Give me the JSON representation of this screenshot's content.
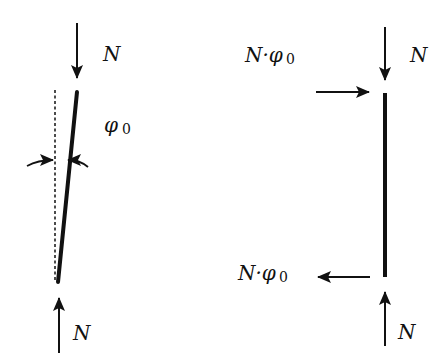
{
  "diagram": {
    "left": {
      "top_force_label": "N",
      "bottom_force_label": "N",
      "angle_symbol": "φ",
      "angle_subscript": "0"
    },
    "right": {
      "top_force_label": "N",
      "bottom_force_label": "N",
      "top_shear_label_main": "N·φ",
      "top_shear_label_sub": "0",
      "bottom_shear_label_main": "N·φ",
      "bottom_shear_label_sub": "0"
    },
    "colors": {
      "ink": "#111111",
      "background": "#ffffff"
    }
  }
}
